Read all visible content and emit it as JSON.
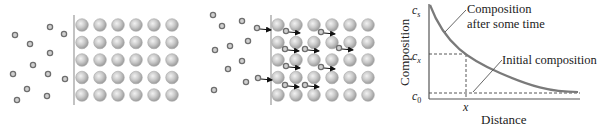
{
  "panels": {
    "left": {
      "description": "Solute atoms approaching a surface before diffusion",
      "interface_x": 74,
      "small_atoms": [
        [
          15,
          35
        ],
        [
          50,
          27
        ],
        [
          64,
          34
        ],
        [
          30,
          44
        ],
        [
          50,
          53
        ],
        [
          33,
          65
        ],
        [
          13,
          74
        ],
        [
          48,
          74
        ],
        [
          65,
          79
        ],
        [
          27,
          89
        ],
        [
          47,
          96
        ],
        [
          17,
          100
        ]
      ],
      "lattice": {
        "x0": 82,
        "dx": 18,
        "y0": 25,
        "dy": 17.5,
        "cols": 6,
        "rows": 5
      }
    },
    "middle": {
      "description": "Solute atoms diffusing into lattice",
      "interface_x": 271,
      "small_atoms": [
        [
          213,
          15
        ],
        [
          222,
          26
        ],
        [
          242,
          21
        ],
        [
          215,
          50
        ],
        [
          230,
          46
        ],
        [
          248,
          41
        ],
        [
          242,
          61
        ],
        [
          228,
          69
        ],
        [
          246,
          82
        ],
        [
          214,
          90
        ]
      ],
      "arrow_atoms": [
        [
          257,
          28
        ],
        [
          286,
          31
        ],
        [
          321,
          32
        ],
        [
          285,
          49
        ],
        [
          305,
          49
        ],
        [
          339,
          48
        ],
        [
          286,
          66
        ],
        [
          321,
          67
        ],
        [
          285,
          85
        ],
        [
          305,
          85
        ],
        [
          258,
          78
        ]
      ],
      "lattice": {
        "x0": 278,
        "dx": 18,
        "y0": 25,
        "dy": 17.5,
        "cols": 6,
        "rows": 5
      }
    }
  },
  "chart_data": {
    "type": "line",
    "title": "",
    "xlabel": "Distance",
    "ylabel": "Composition",
    "y_tick_labels": [
      "c_s",
      "c_x",
      "c_0"
    ],
    "x_tick_labels": [
      "x"
    ],
    "grid": false,
    "legend": null,
    "series": [
      {
        "name": "Composition after some time",
        "shape": "decaying curve from c_s at surface to c_0 at depth",
        "x": [
          0,
          0.1,
          0.25,
          0.4,
          0.55,
          0.7,
          0.85,
          1.0
        ],
        "y": [
          1.0,
          0.78,
          0.52,
          0.33,
          0.2,
          0.1,
          0.04,
          0.02
        ]
      },
      {
        "name": "Initial composition",
        "shape": "constant dashed line at c_0",
        "x": [
          0,
          1.0
        ],
        "y": [
          0.02,
          0.02
        ]
      }
    ],
    "annotations": [
      {
        "text": "Composition after some time",
        "points_to": "curve"
      },
      {
        "text": "Initial composition",
        "points_to": "c_0 dashed line"
      },
      {
        "text": "c_x at x",
        "style": "dashed guide lines"
      }
    ]
  },
  "labels": {
    "cs_main": "c",
    "cs_sub": "s",
    "cx_main": "c",
    "cx_sub": "x",
    "c0_main": "c",
    "c0_sub": "0",
    "x_tick": "x",
    "ylabel": "Composition",
    "xlabel": "Distance",
    "annot1_line1": "Composition",
    "annot1_line2": "after some time",
    "annot2": "Initial composition"
  },
  "colors": {
    "curve": "#7a7a7a",
    "axis": "#555555",
    "dashed": "#444444",
    "small_atom": "#6e6e6e",
    "lattice_atom": "#bdbdbd",
    "arrow": "#111111"
  }
}
